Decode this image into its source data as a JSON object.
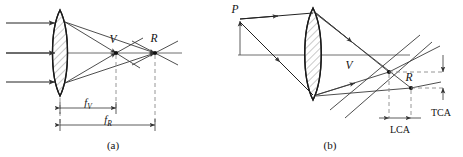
{
  "figure": {
    "background_color": "#ffffff",
    "ink_color": "#222222",
    "axis_color": "#6e6e6e",
    "dash_color": "#8a8a8a",
    "panels": [
      {
        "id": "a",
        "caption": "(a)",
        "description": "Axial chromatic aberration of a biconvex lens with parallel incoming rays",
        "points": [
          {
            "name": "V",
            "label": "V",
            "meaning": "violet focus"
          },
          {
            "name": "R",
            "label": "R",
            "meaning": "red focus"
          }
        ],
        "dimensions": [
          {
            "name": "fV",
            "symbol": "f",
            "subscript": "V",
            "meaning": "violet focal length"
          },
          {
            "name": "fR",
            "symbol": "f",
            "subscript": "R",
            "meaning": "red focal length"
          }
        ],
        "ray_count": 3
      },
      {
        "id": "b",
        "caption": "(b)",
        "description": "Lateral and longitudinal chromatic aberration for an off-axis object point",
        "points": [
          {
            "name": "P",
            "label": "P",
            "meaning": "off-axis object point"
          },
          {
            "name": "V",
            "label": "V",
            "meaning": "violet image point"
          },
          {
            "name": "R",
            "label": "R",
            "meaning": "red image point"
          }
        ],
        "dimensions": [
          {
            "name": "LCA",
            "label": "LCA",
            "meaning": "longitudinal chromatic aberration"
          },
          {
            "name": "TCA",
            "label": "TCA",
            "meaning": "transverse chromatic aberration"
          }
        ],
        "ray_count": 2
      }
    ]
  },
  "labels": {
    "a_caption": "(a)",
    "b_caption": "(b)",
    "a_V": "V",
    "a_R": "R",
    "a_f": "f",
    "a_fV_sub": "V",
    "a_fR_sub": "R",
    "b_P": "P",
    "b_V": "V",
    "b_R": "R",
    "b_LCA": "LCA",
    "b_TCA": "TCA"
  }
}
